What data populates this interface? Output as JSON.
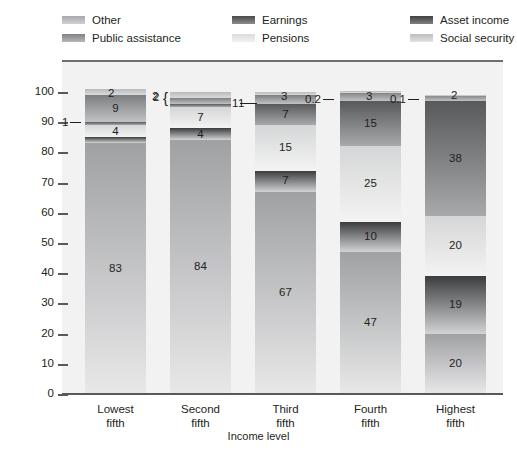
{
  "legend": {
    "columns": [
      {
        "entries": [
          {
            "label": "Other",
            "key": "other",
            "swatch_class": "sw-other"
          },
          {
            "label": "Public assistance",
            "key": "public_assistance",
            "swatch_class": "sw-public"
          }
        ]
      },
      {
        "entries": [
          {
            "label": "Earnings",
            "key": "earnings",
            "swatch_class": "sw-earnings"
          },
          {
            "label": "Pensions",
            "key": "pensions",
            "swatch_class": "sw-pensions"
          }
        ]
      },
      {
        "entries": [
          {
            "label": "Asset income",
            "key": "asset_income",
            "swatch_class": "sw-asset"
          },
          {
            "label": "Social security",
            "key": "social_security",
            "swatch_class": "sw-social"
          }
        ]
      }
    ]
  },
  "axes": {
    "y_title": "Percent",
    "x_title": "Income level",
    "y_ticks": [
      "100",
      "90",
      "80",
      "70",
      "60",
      "50",
      "40",
      "30",
      "20",
      "10",
      "0"
    ],
    "x_categories": [
      {
        "line1": "Lowest",
        "line2": "fifth"
      },
      {
        "line1": "Second",
        "line2": "fifth"
      },
      {
        "line1": "Third",
        "line2": "fifth"
      },
      {
        "line1": "Fourth",
        "line2": "fifth"
      },
      {
        "line1": "Highest",
        "line2": "fifth"
      }
    ]
  },
  "colors": {
    "plot_background": "#f2f2f2",
    "axis_rule": "#58595b",
    "text": "#231f20",
    "other": "#b9babc",
    "public_assistance": "#7d7e80",
    "earnings": "#58595b",
    "pensions": "#d5d6d7",
    "asset_income": "#3b3c3e",
    "social_security": "#a0a1a3"
  },
  "bar_labels": {
    "b0": {
      "other": "2",
      "public_assistance": "9",
      "earnings": "1",
      "pensions": "4",
      "asset_income": "2",
      "social_security": "83"
    },
    "b1": {
      "other": "2",
      "public_assistance": "2",
      "earnings": "1",
      "pensions": "7",
      "asset_income": "4",
      "social_security": "84"
    },
    "b2": {
      "other": "1",
      "public_assistance": "3",
      "earnings": "7",
      "pensions": "15",
      "asset_income": "7",
      "social_security": "67"
    },
    "b3": {
      "other": "0.2",
      "public_assistance": "3",
      "earnings": "15",
      "pensions": "25",
      "asset_income": "10",
      "social_security": "47"
    },
    "b4": {
      "other": "0.1",
      "public_assistance": "2",
      "earnings": "38",
      "pensions": "20",
      "asset_income": "19",
      "social_security": "20"
    }
  },
  "chart_data": {
    "type": "bar",
    "subtype": "stacked-vertical-100pct",
    "title": "",
    "xlabel": "Income level",
    "ylabel": "Percent",
    "ylim": [
      0,
      100
    ],
    "y_ticks": [
      0,
      10,
      20,
      30,
      40,
      50,
      60,
      70,
      80,
      90,
      100
    ],
    "grid": true,
    "legend_position": "top",
    "categories": [
      "Lowest fifth",
      "Second fifth",
      "Third fifth",
      "Fourth fifth",
      "Highest fifth"
    ],
    "stack_order_bottom_to_top": [
      "Social security",
      "Asset income",
      "Pensions",
      "Earnings",
      "Public assistance",
      "Other"
    ],
    "series": [
      {
        "name": "Social security",
        "values": [
          83,
          84,
          67,
          47,
          20
        ]
      },
      {
        "name": "Asset income",
        "values": [
          2,
          4,
          7,
          10,
          19
        ]
      },
      {
        "name": "Pensions",
        "values": [
          4,
          7,
          15,
          25,
          20
        ]
      },
      {
        "name": "Earnings",
        "values": [
          1,
          1,
          7,
          15,
          38
        ]
      },
      {
        "name": "Public assistance",
        "values": [
          9,
          2,
          3,
          3,
          2
        ]
      },
      {
        "name": "Other",
        "values": [
          2,
          2,
          1,
          0.2,
          0.1
        ]
      }
    ],
    "data_labels": {
      "Lowest fifth": {
        "Social security": "83",
        "Asset income": "2",
        "Pensions": "4",
        "Earnings": "1",
        "Public assistance": "9",
        "Other": "2"
      },
      "Second fifth": {
        "Social security": "84",
        "Asset income": "4",
        "Pensions": "7",
        "Earnings": "1",
        "Public assistance": "2",
        "Other": "2"
      },
      "Third fifth": {
        "Social security": "67",
        "Asset income": "7",
        "Pensions": "15",
        "Earnings": "7",
        "Public assistance": "3",
        "Other": "1"
      },
      "Fourth fifth": {
        "Social security": "47",
        "Asset income": "10",
        "Pensions": "25",
        "Earnings": "15",
        "Public assistance": "3",
        "Other": "0.2"
      },
      "Highest fifth": {
        "Social security": "20",
        "Asset income": "19",
        "Pensions": "20",
        "Earnings": "38",
        "Public assistance": "2",
        "Other": "0.1"
      }
    }
  }
}
